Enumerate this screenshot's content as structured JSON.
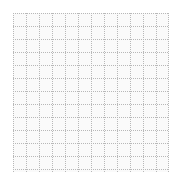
{
  "canvas": {
    "name": "dotted-grid-canvas",
    "width": 175,
    "height": 179,
    "background_color": "#ffffff",
    "label": ""
  },
  "grid": {
    "name": "dotted-grid",
    "label": "",
    "origin_x": 13,
    "origin_y": 13,
    "width": 156,
    "height": 159,
    "cell_size": 13,
    "columns": 12,
    "rows": 12,
    "line_style": "dotted",
    "line_color": "#b8b8b8",
    "line_width": 1,
    "dot_period": 2,
    "cell_fill_color": "#fafafa"
  },
  "chart_data": {
    "type": "table",
    "title": "",
    "xlabel": "",
    "ylabel": "",
    "grid": true,
    "legend": "none",
    "columns": 12,
    "rows": 12,
    "x_ticks": [
      0,
      13,
      26,
      39,
      52,
      65,
      78,
      91,
      104,
      117,
      130,
      143,
      156
    ],
    "y_ticks": [
      0,
      13,
      26,
      39,
      52,
      65,
      78,
      91,
      104,
      117,
      130,
      143,
      156
    ],
    "x_tick_labels": [
      "",
      "",
      "",
      "",
      "",
      "",
      "",
      "",
      "",
      "",
      "",
      "",
      ""
    ],
    "y_tick_labels": [
      "",
      "",
      "",
      "",
      "",
      "",
      "",
      "",
      "",
      "",
      "",
      "",
      ""
    ],
    "xlim": [
      0,
      156
    ],
    "ylim": [
      0,
      159
    ],
    "series": [],
    "values": [],
    "categories": [],
    "annotations": []
  }
}
